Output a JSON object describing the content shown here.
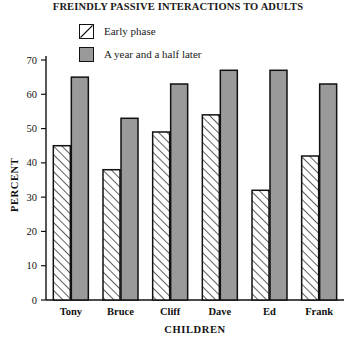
{
  "chart_data": {
    "type": "bar",
    "title": "FREINDLY PASSIVE INTERACTIONS TO ADULTS",
    "xlabel": "CHILDREN",
    "ylabel": "PERCENT",
    "categories": [
      "Tony",
      "Bruce",
      "Cliff",
      "Dave",
      "Ed",
      "Frank"
    ],
    "series": [
      {
        "name": "Early phase",
        "values": [
          45,
          38,
          49,
          54,
          32,
          42
        ],
        "fill": "hatch-diagonal",
        "color": "#ffffff"
      },
      {
        "name": "A year and a half later",
        "values": [
          65,
          53,
          63,
          67,
          67,
          63
        ],
        "fill": "solid",
        "color": "#9a9a9a"
      }
    ],
    "ylim": [
      0,
      70
    ],
    "yticks": [
      0,
      10,
      20,
      30,
      40,
      50,
      60,
      70
    ],
    "ytick_labels": [
      "0",
      "10",
      "20",
      "30",
      "40",
      "50",
      "60",
      "70"
    ],
    "grid": false,
    "legend_position": "top-center"
  },
  "legend": {
    "items": [
      {
        "label": "Early phase",
        "swatch": "hatched-swatch"
      },
      {
        "label": "A year and a half later",
        "swatch": "solid-gray-swatch"
      }
    ]
  },
  "colors": {
    "bar_later": "#9a9a9a",
    "bar_early": "#ffffff",
    "outline": "#111111",
    "background": "#ffffff"
  }
}
